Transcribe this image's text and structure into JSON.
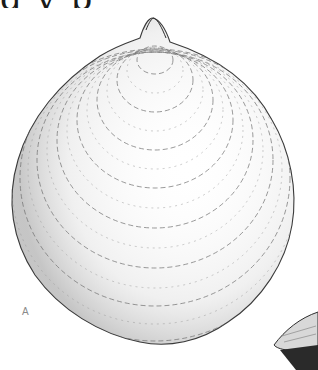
{
  "figure": {
    "plate_label": "A",
    "title_fragment": "g  y  p",
    "colors": {
      "background": "#ffffff",
      "line": "#3a3a3a",
      "shade": "#8c8c8c",
      "label": "#8a8a8a"
    }
  }
}
